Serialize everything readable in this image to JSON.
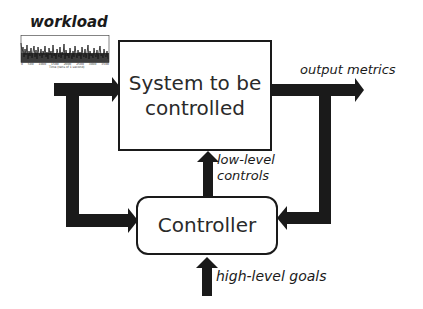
{
  "diagram": {
    "type": "feedback-control-loop",
    "nodes": {
      "system": {
        "label": "System to be controlled"
      },
      "controller": {
        "label": "Controller"
      }
    },
    "labels": {
      "workload": "workload",
      "output_metrics": "output metrics",
      "low_level_controls": "low-level",
      "low_level_controls_2": "controls",
      "high_level_goals": "high-level goals"
    },
    "system_text": {
      "line1": "System to be",
      "line2": "controlled"
    },
    "edges": [
      {
        "from": "workload",
        "to": "system",
        "label": ""
      },
      {
        "from": "workload",
        "to": "controller",
        "label": ""
      },
      {
        "from": "system",
        "to": "output",
        "label": "output metrics"
      },
      {
        "from": "system",
        "to": "controller",
        "label": ""
      },
      {
        "from": "controller",
        "to": "system",
        "label": "low-level controls"
      },
      {
        "from": "goals",
        "to": "controller",
        "label": "high-level goals"
      }
    ],
    "workload_chart": {
      "x_ticks": [
        "0",
        "500",
        "1000",
        "1500",
        "2000",
        "2500",
        "3000",
        "3500"
      ],
      "x_label": "Time (tens of 1 second)"
    },
    "colors": {
      "stroke": "#1a1a1a",
      "background": "#ffffff"
    }
  }
}
